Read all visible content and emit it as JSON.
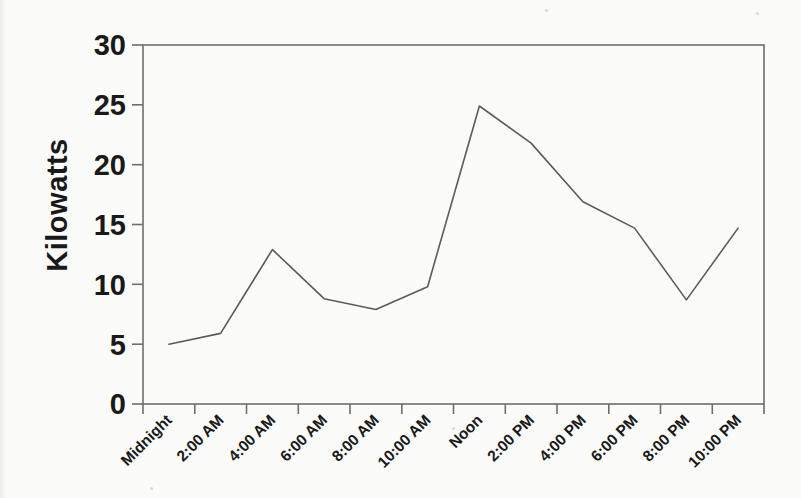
{
  "chart_data": {
    "type": "line",
    "title": "",
    "xlabel": "",
    "ylabel": "Kilowatts",
    "categories": [
      "Midnight",
      "2:00 AM",
      "4:00 AM",
      "6:00 AM",
      "8:00 AM",
      "10:00 AM",
      "Noon",
      "2:00 PM",
      "4:00 PM",
      "6:00 PM",
      "8:00 PM",
      "10:00 PM"
    ],
    "values": [
      5,
      5.9,
      12.9,
      8.8,
      7.9,
      9.8,
      24.9,
      21.8,
      16.9,
      14.7,
      8.7,
      14.7
    ],
    "ylim": [
      0,
      30
    ],
    "yticks": [
      0,
      5,
      10,
      15,
      20,
      25,
      30
    ],
    "grid": false,
    "legend": false,
    "line_color": "#5b5b5b",
    "axis_color": "#6e6e6e",
    "text_color": "#191919"
  }
}
